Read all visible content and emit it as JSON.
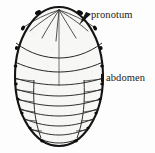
{
  "figure": {
    "kind": "anatomical-line-drawing",
    "background_color": "#fdfdfd",
    "ink_color": "#1a1a1a",
    "fill_color": "#f7f7f5",
    "width": 155,
    "height": 153
  },
  "labels": [
    {
      "id": "pronotum",
      "text": "pronotum",
      "x": 91,
      "y": 9,
      "leader": "wedge pointing down-left to upper body margin"
    },
    {
      "id": "abdomen",
      "text": "abdomen",
      "x": 106,
      "y": 72,
      "leader": "short mark touching right body margin"
    }
  ],
  "body": {
    "outline": "oval",
    "center_x": 59,
    "top_y": 7,
    "bottom_y": 146,
    "left_x": 15,
    "right_x": 103,
    "regions": [
      {
        "name": "pronotum",
        "description": "rounded anterior shield with radiating ribs"
      },
      {
        "name": "abdomen",
        "description": "posterior segmented region with transverse segment lines and lateral plates"
      }
    ],
    "segment_count": 9,
    "midline": true
  }
}
